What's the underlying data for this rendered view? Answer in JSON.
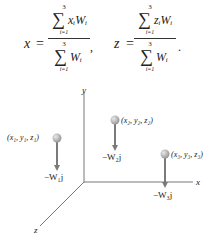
{
  "equations": {
    "x_lhs": "x",
    "z_lhs": "z",
    "equals": "=",
    "sigma": "∑",
    "upper": "3",
    "lower": "i=1",
    "x_numerator_term": "xᵢWᵢ",
    "z_numerator_term": "zᵢWᵢ",
    "denominator_term": "Wᵢ",
    "comma": ",",
    "period": "."
  },
  "diagram": {
    "axes": {
      "x": "x",
      "y": "y",
      "z": "z"
    },
    "points": [
      {
        "label": "(x₁, y₁, z₁)",
        "force": "−W₁j"
      },
      {
        "label": "(x₂, y₂, z₂)",
        "force": "−W₂j"
      },
      {
        "label": "(x₃, y₃, z₃)",
        "force": "−W₃j"
      }
    ],
    "colors": {
      "axis": "#555555",
      "arrow": "#7a7a7a",
      "ball": "#b5b5b5"
    }
  }
}
